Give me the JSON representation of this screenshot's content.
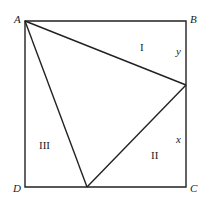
{
  "diagram": {
    "type": "geometry",
    "vertices": {
      "A": {
        "label": "A",
        "x": 25,
        "y": 21
      },
      "B": {
        "label": "B",
        "x": 186,
        "y": 21
      },
      "C": {
        "label": "C",
        "x": 186,
        "y": 187
      },
      "D": {
        "label": "D",
        "x": 25,
        "y": 187
      },
      "E": {
        "x": 186,
        "y": 85
      },
      "F": {
        "x": 87,
        "y": 187
      }
    },
    "regions": [
      {
        "label": "I"
      },
      {
        "label": "II"
      },
      {
        "label": "III"
      }
    ],
    "segment_labels": {
      "y": "y",
      "x": "x"
    },
    "stroke_color": "#222222"
  }
}
